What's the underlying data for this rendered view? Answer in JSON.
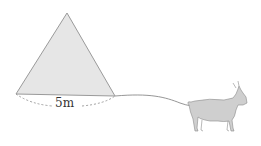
{
  "diagram": {
    "triangle": {
      "fill": "#e6e6e6",
      "stroke": "#9a9a9a"
    },
    "side_label": "5m",
    "rope_color": "#9a9a9a",
    "goat": {
      "body": "#cfcfcf",
      "stroke": "#8a8a8a"
    }
  }
}
